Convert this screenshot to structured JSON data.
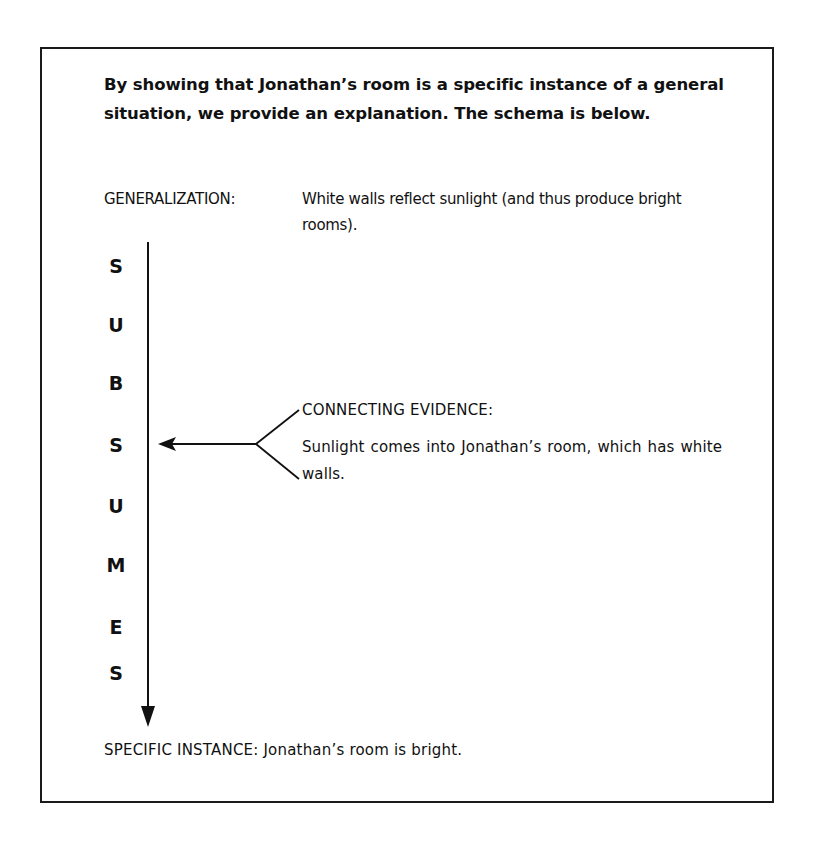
{
  "heading": "By showing that Jonathan’s room is a specific instance of a general situation, we provide an explanation. The schema is below.",
  "generalization": {
    "label": "GENERALIZATION:",
    "text": "White walls reflect sunlight (and thus produce bright rooms)."
  },
  "subsumes": {
    "letters": [
      "S",
      "U",
      "B",
      "S",
      "U",
      "M",
      "E",
      "S"
    ],
    "word": "SUBSUMES"
  },
  "connecting_evidence": {
    "label": "CONNECTING EVIDENCE:",
    "text": "Sunlight comes into Jonathan’s room, which has white walls."
  },
  "specific_instance": {
    "label": "SPECIFIC INSTANCE:",
    "text": "Jonathan’s room is bright."
  },
  "colors": {
    "ink": "#111111",
    "border": "#1a1a1a",
    "background": "#ffffff"
  }
}
